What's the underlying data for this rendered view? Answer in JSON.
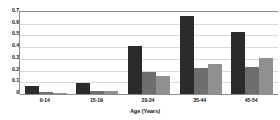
{
  "chart_data": {
    "type": "bar",
    "title": "",
    "xlabel": "Age (Years)",
    "ylabel": "",
    "categories": [
      "0-14",
      "15-19",
      "20-34",
      "35-44",
      "45-54"
    ],
    "series": [
      {
        "name": "series-1",
        "color": "#2b2b2b",
        "values": [
          0.07,
          0.09,
          0.41,
          0.67,
          0.53
        ]
      },
      {
        "name": "series-2",
        "color": "#6e6e6e",
        "values": [
          0.02,
          0.03,
          0.19,
          0.22,
          0.23
        ]
      },
      {
        "name": "series-3",
        "color": "#909090",
        "values": [
          0.01,
          0.03,
          0.15,
          0.26,
          0.31
        ]
      }
    ],
    "ylim": [
      0,
      0.7
    ],
    "yticks": [
      0.7,
      0.6,
      0.5,
      0.4,
      0.3,
      0.2,
      0.1,
      0
    ],
    "ytick_labels": [
      "0.7",
      "0.6",
      "0.5",
      "0.4",
      "0.3",
      "0.2",
      "0.1",
      "0"
    ],
    "grid": true,
    "legend": "none",
    "bar_count_per_group": 3
  },
  "axis": {
    "x_title": "Age (Years)"
  },
  "colors": {
    "gridline": "#d9d9d9",
    "axis_line": "#8a8a8a",
    "background": "#ffffff",
    "text": "#111111"
  }
}
